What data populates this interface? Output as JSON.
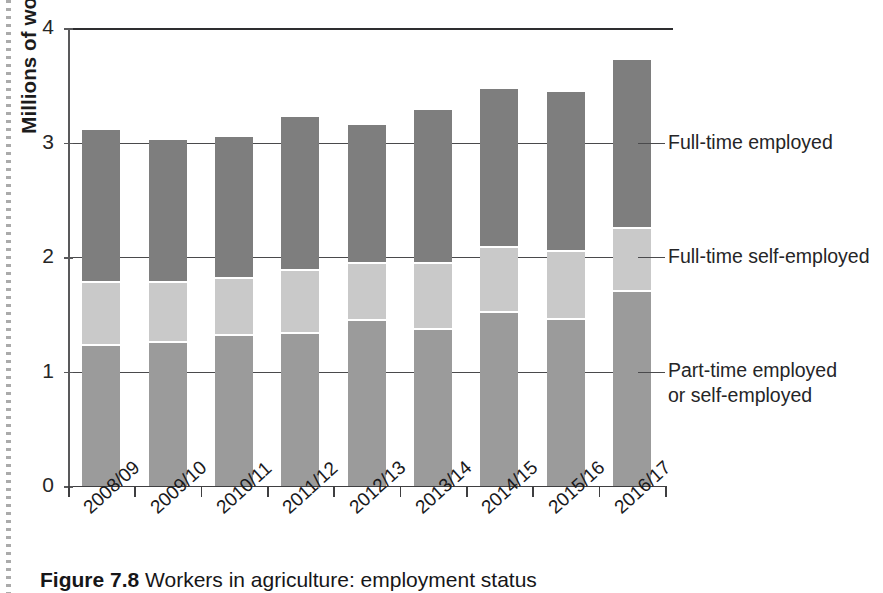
{
  "figure": {
    "caption_prefix": "Figure",
    "caption_number": "7.8",
    "caption_text": "Workers in agriculture: employment status",
    "y_axis_title": "Millions of workers"
  },
  "axis": {
    "y_ticks": [
      "0",
      "1",
      "2",
      "3",
      "4"
    ],
    "y_min": 0,
    "y_max": 4
  },
  "legend": {
    "items": [
      {
        "label": "Full-time employed",
        "color": "#7e7e7e"
      },
      {
        "label": "Full-time self-employed",
        "color": "#c9c9c9"
      },
      {
        "label_line1": "Part-time employed",
        "label_line2": "or self-employed",
        "color": "#9b9b9b"
      }
    ]
  },
  "chart_data": {
    "type": "bar",
    "stacked": true,
    "title": "",
    "xlabel": "",
    "ylabel": "Millions of workers",
    "ylim": [
      0,
      4
    ],
    "yticks": [
      0,
      1,
      2,
      3,
      4
    ],
    "grid": true,
    "legend_position": "right",
    "categories": [
      "2008/09",
      "2009/10",
      "2010/11",
      "2011/12",
      "2012/13",
      "2013/14",
      "2014/15",
      "2015/16",
      "2016/17"
    ],
    "series": [
      {
        "name": "Part-time employed or self-employed",
        "color": "#9b9b9b",
        "values": [
          1.23,
          1.26,
          1.32,
          1.34,
          1.45,
          1.37,
          1.52,
          1.46,
          1.7
        ]
      },
      {
        "name": "Full-time self-employed",
        "color": "#c9c9c9",
        "values": [
          0.55,
          0.52,
          0.5,
          0.55,
          0.5,
          0.58,
          0.57,
          0.59,
          0.55
        ]
      },
      {
        "name": "Full-time employed",
        "color": "#7e7e7e",
        "values": [
          1.33,
          1.24,
          1.23,
          1.33,
          1.2,
          1.33,
          1.38,
          1.39,
          1.47
        ]
      }
    ],
    "totals": [
      3.11,
      3.02,
      3.05,
      3.22,
      3.15,
      3.28,
      3.47,
      3.44,
      3.72
    ]
  }
}
